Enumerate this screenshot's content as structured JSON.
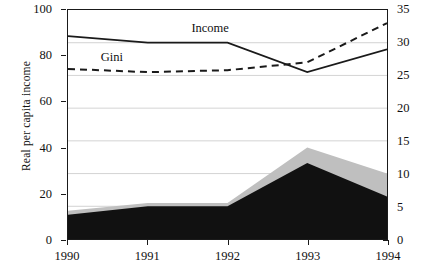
{
  "axes": {
    "left_title": "Real per capita income",
    "left_ticks": [
      "0",
      "20",
      "40",
      "60",
      "80",
      "100"
    ],
    "right_ticks": [
      "0",
      "5",
      "10",
      "15",
      "20",
      "25",
      "30",
      "35"
    ],
    "x_ticks": [
      "1990",
      "1991",
      "1992",
      "1993",
      "1994"
    ]
  },
  "annotations": {
    "income_label": "Income",
    "gini_label": "Gini"
  },
  "colors": {
    "line": "#1a1a1a",
    "area_dark": "#111111",
    "area_light": "#bfbfbf",
    "grid": "#c8c8c8"
  },
  "chart_data": {
    "type": "line",
    "title": "",
    "xlabel": "",
    "ylabel": "Real per capita income",
    "x": [
      1990,
      1991,
      1992,
      1993,
      1994
    ],
    "categories": [
      "1990",
      "1991",
      "1992",
      "1993",
      "1994"
    ],
    "ylim": [
      0,
      100
    ],
    "y2lim": [
      0,
      35
    ],
    "grid": true,
    "legend": "inline-annotations",
    "series": [
      {
        "name": "Income",
        "style": "solid-line",
        "axis": "right",
        "values": [
          31.0,
          30.0,
          30.0,
          25.5,
          29.0
        ]
      },
      {
        "name": "Gini",
        "style": "dashed-line",
        "axis": "right",
        "values": [
          26.0,
          25.5,
          25.8,
          27.0,
          33.0
        ]
      },
      {
        "name": "Lower stacked area (black)",
        "style": "filled-area-dark",
        "axis": "right",
        "values": [
          3.7,
          5.0,
          5.0,
          11.6,
          6.5
        ]
      },
      {
        "name": "Upper stacked area (gray)",
        "style": "filled-area-light",
        "axis": "right",
        "values": [
          4.3,
          5.5,
          5.5,
          14.0,
          10.0
        ]
      }
    ]
  }
}
